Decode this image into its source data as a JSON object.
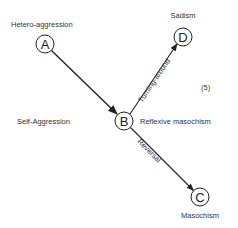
{
  "diagram": {
    "nodes": [
      {
        "id": "A",
        "letter": "A",
        "label": "Hetero-aggression",
        "cx": 45,
        "cy": 44
      },
      {
        "id": "B",
        "letter": "B",
        "label": "Reflexive masochism",
        "cx": 124,
        "cy": 121
      },
      {
        "id": "C",
        "letter": "C",
        "label": "Masochism",
        "cx": 200,
        "cy": 197
      },
      {
        "id": "D",
        "letter": "D",
        "label": "Sadism",
        "cx": 183,
        "cy": 37
      }
    ],
    "edges": [
      {
        "from": "A",
        "to": "B",
        "label": ""
      },
      {
        "from": "B",
        "to": "D",
        "label": "Turning-around"
      },
      {
        "from": "B",
        "to": "C",
        "label": "Reversal"
      }
    ],
    "side_label": "Self-Aggression",
    "figure_number": "(5)",
    "colors": {
      "stroke": "#222222",
      "text": "#333333",
      "background": "#ffffff"
    }
  }
}
